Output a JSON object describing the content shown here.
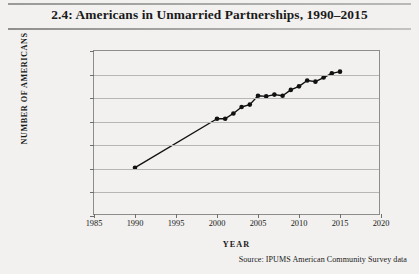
{
  "figure": {
    "title": "2.4: Americans in Unmarried Partnerships, 1990–2015",
    "source": "Source:  IPUMS American Community Survey data"
  },
  "chart_data": {
    "type": "line",
    "title": "2.4: Americans in Unmarried Partnerships, 1990–2015",
    "xlabel": "YEAR",
    "ylabel": "NUMBER OF AMERICANS",
    "xlim": [
      1985,
      2020
    ],
    "ylim": [
      2000000,
      16000000
    ],
    "xticks": [
      1985,
      1990,
      1995,
      2000,
      2005,
      2010,
      2015,
      2020
    ],
    "xtick_labels": [
      "1985",
      "1990",
      "1995",
      "2000",
      "2005",
      "2010",
      "2015",
      "2020"
    ],
    "yticks": [
      2000000,
      4000000,
      6000000,
      8000000,
      10000000,
      12000000,
      14000000,
      16000000
    ],
    "ytick_labels": [
      "2,000,000",
      "4,000,000",
      "6,000,000",
      "8,000,000",
      "10,000,000",
      "12,000,000",
      "14,000,000",
      "16,000,000"
    ],
    "grid": "horizontal",
    "legend": "none",
    "marker": "filled-circle",
    "line_color": "#111111",
    "x": [
      1990,
      2000,
      2001,
      2002,
      2003,
      2004,
      2005,
      2006,
      2007,
      2008,
      2009,
      2010,
      2011,
      2012,
      2013,
      2014,
      2015
    ],
    "values": [
      6100000,
      10250000,
      10250000,
      10700000,
      11250000,
      11450000,
      12200000,
      12150000,
      12300000,
      12200000,
      12700000,
      13000000,
      13500000,
      13400000,
      13750000,
      14100000,
      14250000
    ],
    "series": [
      {
        "name": "Americans in unmarried partnerships",
        "x": [
          1990,
          2000,
          2001,
          2002,
          2003,
          2004,
          2005,
          2006,
          2007,
          2008,
          2009,
          2010,
          2011,
          2012,
          2013,
          2014,
          2015
        ],
        "values": [
          6100000,
          10250000,
          10250000,
          10700000,
          11250000,
          11450000,
          12200000,
          12150000,
          12300000,
          12200000,
          12700000,
          13000000,
          13500000,
          13400000,
          13750000,
          14100000,
          14250000
        ]
      }
    ]
  }
}
